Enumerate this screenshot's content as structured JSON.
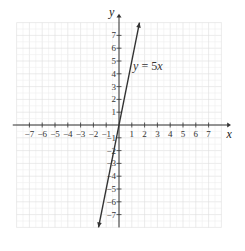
{
  "chart_data": {
    "type": "line",
    "title": "",
    "xlabel": "x",
    "ylabel": "y",
    "xlim": [
      -8,
      8
    ],
    "ylim": [
      -8,
      8
    ],
    "grid": true,
    "x_ticks": [
      -7,
      -6,
      -5,
      -4,
      -3,
      -2,
      -1,
      1,
      2,
      3,
      4,
      5,
      6,
      7
    ],
    "y_ticks": [
      -7,
      -6,
      -5,
      -4,
      -3,
      -2,
      -1,
      1,
      2,
      3,
      4,
      5,
      6,
      7
    ],
    "series": [
      {
        "name": "y = 5x",
        "slope": 5,
        "intercept": 0,
        "x": [
          -1.6,
          1.6
        ],
        "y": [
          -8,
          8
        ]
      }
    ],
    "annotations": [
      {
        "text": "y = 5x",
        "x": 1.1,
        "y": 4.3
      }
    ]
  },
  "labels": {
    "x_axis": "x",
    "y_axis": "y",
    "equation": "y = 5x"
  }
}
